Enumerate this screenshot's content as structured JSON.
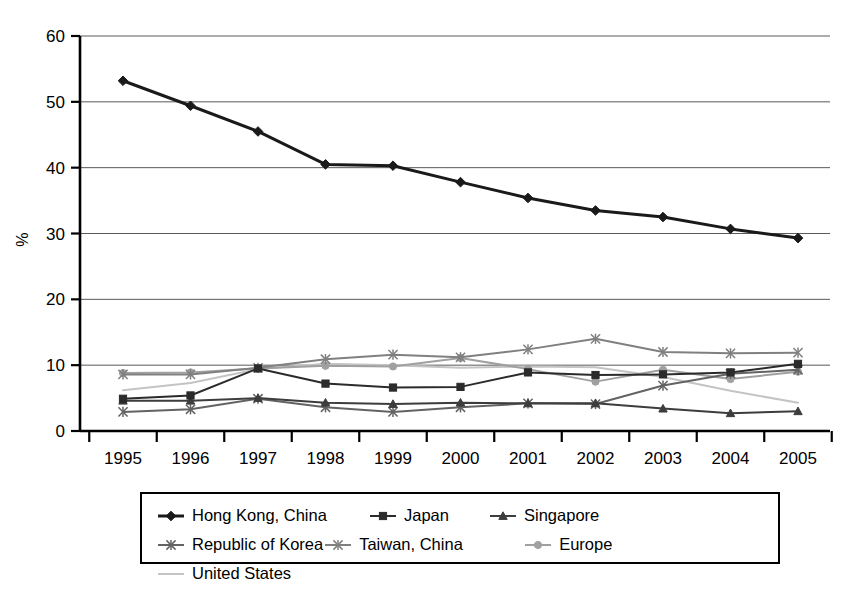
{
  "chart_data": {
    "type": "line",
    "title": "",
    "subtitle": "",
    "xlabel": "",
    "ylabel": "%",
    "categories": [
      "1995",
      "1996",
      "1997",
      "1998",
      "1999",
      "2000",
      "2001",
      "2002",
      "2003",
      "2004",
      "2005"
    ],
    "x": [
      1995,
      1996,
      1997,
      1998,
      1999,
      2000,
      2001,
      2002,
      2003,
      2004,
      2005
    ],
    "ylim": [
      0,
      60
    ],
    "yticks": [
      0,
      10,
      20,
      30,
      40,
      50,
      60
    ],
    "ytick_labels": [
      "0",
      "10",
      "20",
      "30",
      "40",
      "50",
      "60"
    ],
    "grid": "horizontal",
    "legend_position": "bottom",
    "series": [
      {
        "name": "Hong Kong, China",
        "color": "#1a1a1a",
        "marker": "diamond",
        "line_width": 3.0,
        "values": [
          53.2,
          49.4,
          45.5,
          40.5,
          40.3,
          37.8,
          35.4,
          33.5,
          32.5,
          30.7,
          29.3
        ]
      },
      {
        "name": "Japan",
        "color": "#2b2b2b",
        "marker": "square",
        "line_width": 2.0,
        "values": [
          4.9,
          5.4,
          9.5,
          7.2,
          6.6,
          6.7,
          8.9,
          8.5,
          8.6,
          8.9,
          10.2
        ]
      },
      {
        "name": "Singapore",
        "color": "#3d3d3d",
        "marker": "triangle",
        "line_width": 2.0,
        "values": [
          4.6,
          4.6,
          5.0,
          4.3,
          4.1,
          4.3,
          4.2,
          4.2,
          3.4,
          2.7,
          3.0
        ]
      },
      {
        "name": "Republic of Korea",
        "color": "#636363",
        "marker": "star",
        "line_width": 2.0,
        "values": [
          2.9,
          3.3,
          4.9,
          3.6,
          2.9,
          3.6,
          4.2,
          4.1,
          6.9,
          8.7,
          9.3
        ]
      },
      {
        "name": "Taiwan, China",
        "color": "#808080",
        "marker": "star",
        "line_width": 2.0,
        "values": [
          8.6,
          8.6,
          9.6,
          10.9,
          11.6,
          11.2,
          12.4,
          14.0,
          12.0,
          11.8,
          11.9
        ]
      },
      {
        "name": "Europe",
        "color": "#a0a0a0",
        "marker": "circle",
        "line_width": 2.0,
        "values": [
          8.8,
          8.9,
          9.5,
          9.9,
          9.8,
          11.1,
          9.4,
          7.5,
          9.3,
          7.9,
          9.0
        ]
      },
      {
        "name": "United States",
        "color": "#c4c4c4",
        "marker": "none",
        "line_width": 2.0,
        "values": [
          6.2,
          7.3,
          9.4,
          10.2,
          10.0,
          9.6,
          9.8,
          9.7,
          8.2,
          6.1,
          4.3
        ]
      }
    ]
  },
  "axis": {
    "y_title": "%"
  },
  "legend": {
    "items": [
      {
        "label": "Hong Kong, China"
      },
      {
        "label": "Japan"
      },
      {
        "label": "Singapore"
      },
      {
        "label": "Republic of Korea"
      },
      {
        "label": "Taiwan, China"
      },
      {
        "label": "Europe"
      },
      {
        "label": "United States"
      }
    ]
  }
}
